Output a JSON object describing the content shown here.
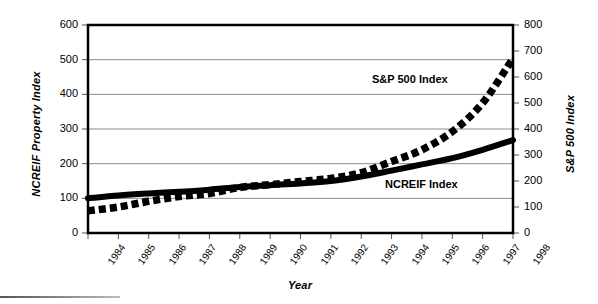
{
  "chart_data": {
    "type": "line",
    "title": "",
    "xlabel": "Year",
    "ylabel": "NCREIF Property Index",
    "y2label": "S&P 500 Index",
    "grid": true,
    "legend_position": "inline-annotations",
    "x": [
      1984,
      1985,
      1986,
      1987,
      1988,
      1989,
      1990,
      1991,
      1992,
      1993,
      1994,
      1995,
      1996,
      1997,
      1998
    ],
    "categories": [
      "1984",
      "1985",
      "1986",
      "1987",
      "1988",
      "1989",
      "1990",
      "1991",
      "1992",
      "1993",
      "1994",
      "1995",
      "1996",
      "1997",
      "1998"
    ],
    "xlim": [
      1984,
      1998
    ],
    "ylim": [
      0,
      600
    ],
    "y2lim": [
      0,
      800
    ],
    "yticks": [
      0,
      100,
      200,
      300,
      400,
      500,
      600
    ],
    "y2ticks": [
      0,
      100,
      200,
      300,
      400,
      500,
      600,
      700,
      800
    ],
    "series": [
      {
        "name": "NCREIF Index",
        "axis": "left",
        "style": "solid",
        "color": "#000000",
        "values": [
          100,
          108,
          114,
          119,
          125,
          133,
          138,
          143,
          150,
          163,
          180,
          198,
          216,
          240,
          268
        ]
      },
      {
        "name": "S&P 500 Index",
        "axis": "right",
        "style": "dashed",
        "color": "#000000",
        "values": [
          85,
          100,
          122,
          140,
          152,
          175,
          186,
          198,
          210,
          232,
          275,
          320,
          390,
          500,
          672
        ]
      }
    ],
    "annotations": [
      {
        "text": "S&P 500 Index",
        "x": 1992.6,
        "y2": 630
      },
      {
        "text": "NCREIF Index",
        "x": 1993.0,
        "y": 160
      }
    ]
  },
  "axes": {
    "left": {
      "title": "NCREIF Property Index",
      "ticks": [
        "600",
        "500",
        "400",
        "300",
        "200",
        "100",
        "0"
      ]
    },
    "right": {
      "title": "S&P 500 Index",
      "ticks": [
        "800",
        "700",
        "600",
        "500",
        "400",
        "300",
        "200",
        "100",
        "0"
      ]
    },
    "bottom": {
      "title": "Year",
      "ticks": [
        "1984",
        "1985",
        "1986",
        "1987",
        "1988",
        "1989",
        "1990",
        "1991",
        "1992",
        "1993",
        "1994",
        "1995",
        "1996",
        "1997",
        "1998"
      ]
    }
  },
  "series_labels": {
    "sp500": "S&P 500 Index",
    "ncreif": "NCREIF Index"
  },
  "colors": {
    "line": "#000000",
    "grid": "#8c8c8c",
    "frame": "#000000",
    "background": "#ffffff"
  }
}
